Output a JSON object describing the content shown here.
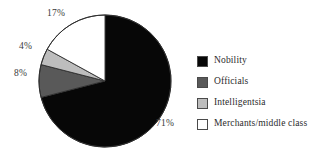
{
  "chart_data": {
    "type": "pie",
    "title": "",
    "subtitle": "",
    "xlabel": "",
    "ylabel": "",
    "legend_position": "right",
    "grid": false,
    "start_angle_deg": 0,
    "direction": "clockwise",
    "categories": [
      "Nobility",
      "Officials",
      "Intelligentsia",
      "Merchants/middle class"
    ],
    "values": [
      71,
      8,
      4,
      17
    ],
    "value_labels": [
      "71%",
      "8%",
      "4%",
      "17%"
    ],
    "colors": [
      "#070707",
      "#595959",
      "#bdbdbd",
      "#ffffff"
    ],
    "slices": [
      {
        "label": "Nobility",
        "value": 71,
        "value_label": "71%",
        "color": "#070707"
      },
      {
        "label": "Officials",
        "value": 8,
        "value_label": "8%",
        "color": "#595959"
      },
      {
        "label": "Intelligentsia",
        "value": 4,
        "value_label": "4%",
        "color": "#bdbdbd"
      },
      {
        "label": "Merchants/middle class",
        "value": 17,
        "value_label": "17%",
        "color": "#ffffff"
      }
    ]
  },
  "legend": {
    "items": [
      {
        "label": "Nobility",
        "color": "#070707"
      },
      {
        "label": "Officials",
        "color": "#595959"
      },
      {
        "label": "Intelligentsia",
        "color": "#bdbdbd"
      },
      {
        "label": "Merchants/middle class",
        "color": "#ffffff"
      }
    ]
  },
  "style": {
    "background": "#ffffff",
    "outline": "#2f2f2f",
    "label_color": "#3a3a3a"
  }
}
